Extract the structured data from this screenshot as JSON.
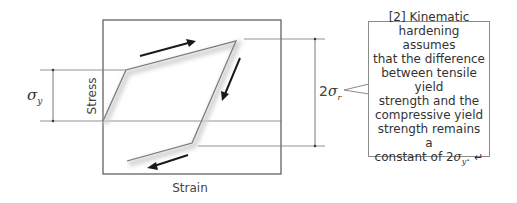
{
  "diagram": {
    "x_axis_label": "Strain",
    "y_axis_label": "Stress",
    "left_dimension": {
      "symbol": "σ",
      "subscript": "y"
    },
    "right_dimension": {
      "coefficient": "2",
      "symbol": "σ",
      "subscript": "r"
    },
    "colors": {
      "frame": "#555555",
      "curve": "#777777",
      "arrow": "#1a1a1a",
      "shadow": "#d0d0d0"
    }
  },
  "callout": {
    "lines": [
      "[2] Kinematic",
      "hardening assumes",
      "that the difference",
      "between tensile yield",
      "strength and the",
      "compressive yield",
      "strength remains a"
    ],
    "last_line_prefix": "constant of 2",
    "last_symbol": "σ",
    "last_subscript": "y",
    "last_suffix": ".",
    "return_icon": "↵"
  }
}
